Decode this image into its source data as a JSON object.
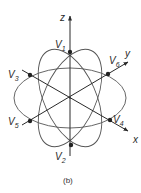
{
  "diagram": {
    "caption": "(b)",
    "axes": {
      "z": "z",
      "y": "y",
      "x": "x"
    },
    "vertices": {
      "v1": {
        "letter": "V",
        "sub": "1"
      },
      "v2": {
        "letter": "V",
        "sub": "2"
      },
      "v3": {
        "letter": "V",
        "sub": "3"
      },
      "v4": {
        "letter": "V",
        "sub": "4"
      },
      "v5": {
        "letter": "V",
        "sub": "5"
      },
      "v6": {
        "letter": "V",
        "sub": "6"
      }
    },
    "colors": {
      "line": "#3a3a3a",
      "background": "#ffffff"
    }
  }
}
